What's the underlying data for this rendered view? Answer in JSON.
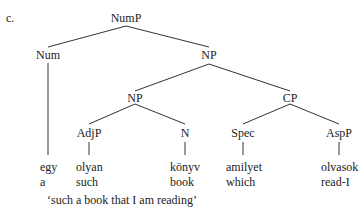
{
  "example_label": "c.",
  "nodes": {
    "nump": "NumP",
    "num": "Num",
    "np_top": "NP",
    "np_mid": "NP",
    "cp": "CP",
    "adjp": "AdjP",
    "n": "N",
    "spec": "Spec",
    "aspp": "AspP"
  },
  "words": [
    {
      "hungarian": "egy",
      "english": "a"
    },
    {
      "hungarian": "olyan",
      "english": "such"
    },
    {
      "hungarian": "könyv",
      "english": "book"
    },
    {
      "hungarian": "amilyet",
      "english": "which"
    },
    {
      "hungarian": "olvasok",
      "english": "read-I"
    }
  ],
  "translation": "‘such a book that I am reading’"
}
